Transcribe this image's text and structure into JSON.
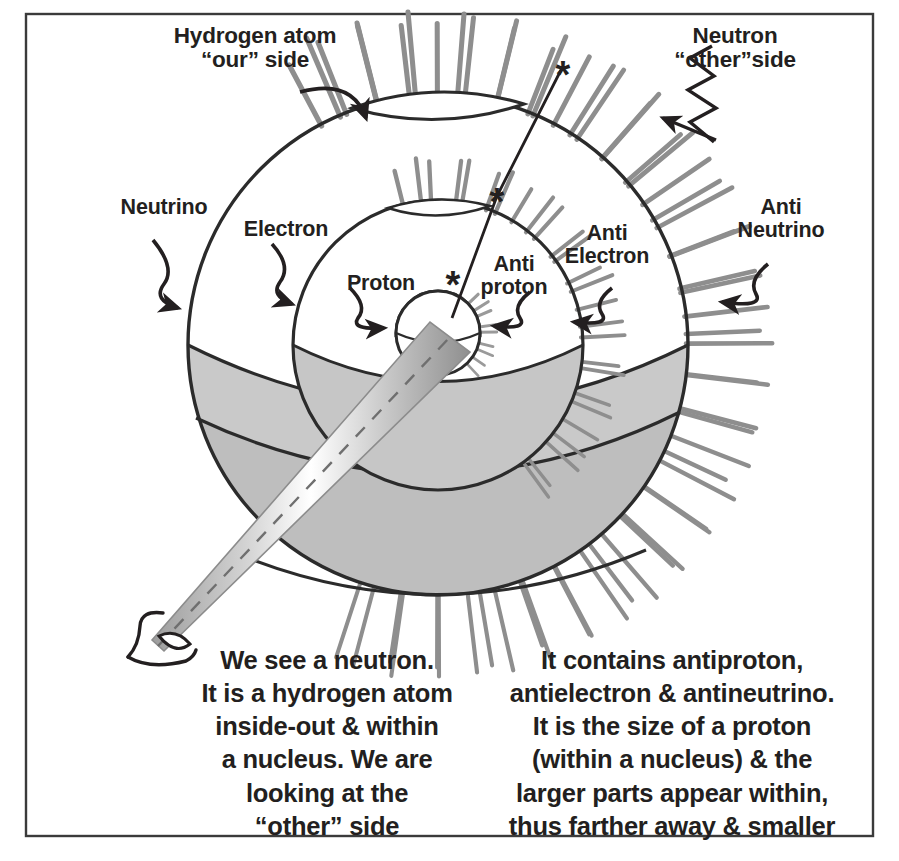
{
  "figure": {
    "frame": {
      "border_color": "#3b3b3b",
      "background": "#ffffff"
    },
    "palette": {
      "ink": "#231f20",
      "outline": "#2b2b2b",
      "spike_gray": "#8e8e8e",
      "fill_light": "#d7d7d7",
      "fill_mid": "#c9c9c9",
      "fill_dark": "#bcbcbc",
      "cone_gradient_light": "#ffffff",
      "cone_gradient_dark": "#9a9a9a"
    },
    "labels": [
      {
        "name": "hydrogen-atom-our-side",
        "text": "Hydrogen atom\n“our” side",
        "points_to": "outer-sphere-surface",
        "arrow": "curved-arrow-down-right"
      },
      {
        "name": "neutron-other-side",
        "text": "Neutron\n“other”side",
        "points_to": "outer-spike-corona",
        "arrow": "zigzag-arrow-down-left"
      },
      {
        "name": "neutrino",
        "text": "Neutrino",
        "points_to": "outer-sphere-shell",
        "arrow": "squiggle-arrow-right"
      },
      {
        "name": "electron",
        "text": "Electron",
        "points_to": "middle-sphere-shell",
        "arrow": "squiggle-arrow-right"
      },
      {
        "name": "proton",
        "text": "Proton",
        "points_to": "inner-core-sphere",
        "arrow": "squiggle-arrow-right"
      },
      {
        "name": "anti-proton",
        "text": "Anti\nproton",
        "points_to": "inner-core-sphere",
        "arrow": "squiggle-arrow-left"
      },
      {
        "name": "anti-electron",
        "text": "Anti\nElectron",
        "points_to": "middle-sphere-spikes",
        "arrow": "squiggle-arrow-left"
      },
      {
        "name": "anti-neutrino",
        "text": "Anti\nNeutrino",
        "points_to": "outer-spike-corona",
        "arrow": "squiggle-arrow-left"
      }
    ],
    "captions": {
      "left": "We see a neutron.\nIt is a hydrogen atom\ninside-out & within\na nucleus. We are\nlooking at the\n“other” side",
      "right": "It contains antiproton,\nantielectron & antineutrino.\nIt is the size of a proton\n(within a nucleus) & the\nlarger parts appear within,\nthus farther away & smaller"
    },
    "markers": {
      "asterisk_count": 3,
      "asterisk_glyph": "*",
      "description": "three asterisk markers along a radial sight-line crossing each nested shell"
    },
    "viewer": {
      "icon": "eye-icon",
      "cone": "view-cone-with-dashed-axis"
    }
  }
}
